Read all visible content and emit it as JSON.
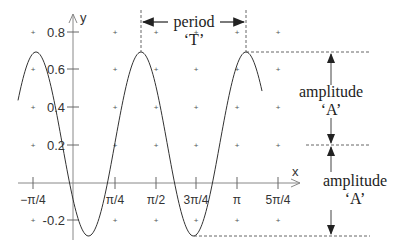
{
  "chart_data": {
    "type": "line",
    "title": "",
    "xlabel": "x",
    "ylabel": "y",
    "x_ticks": [
      "−π/4",
      "π/4",
      "π/2",
      "3π/4",
      "π",
      "5π/4"
    ],
    "y_ticks": [
      "0.8",
      "0.6",
      "0.4",
      "0.2",
      "-0.2"
    ],
    "ylim": [
      -0.28,
      0.85
    ],
    "grid": "dot markers",
    "series": [
      {
        "name": "sinusoid",
        "function": "y = 0.2 + 0.49*cos(2*pi*(x - 0.5*pi)/(0.8*pi))",
        "peaks_y": 0.69,
        "troughs_y": -0.29
      }
    ],
    "annotations": {
      "period_label": "period",
      "period_symbol": "‘T’",
      "amplitude_top_label": "amplitude",
      "amplitude_top_symbol": "‘A’",
      "amplitude_bottom_label": "amplitude",
      "amplitude_bottom_symbol": "‘A’"
    }
  }
}
